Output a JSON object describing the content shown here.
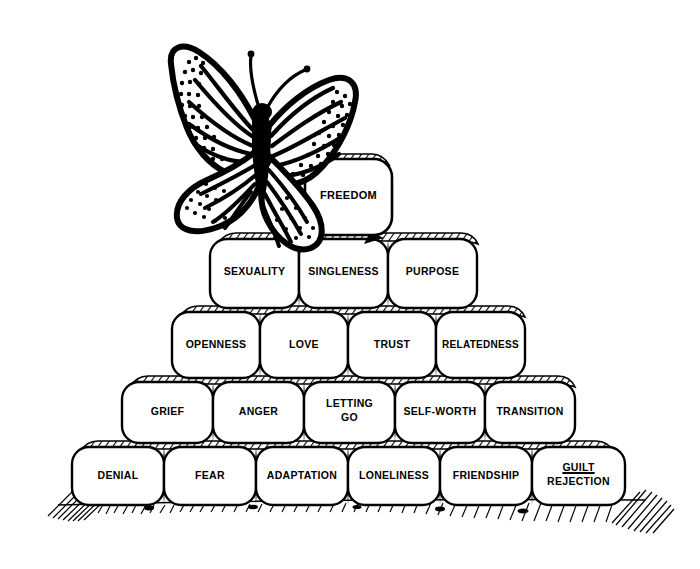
{
  "figure": {
    "title_text": "",
    "style": "black-and-white line drawing",
    "ink_color": "#000000",
    "background_color": "#ffffff"
  },
  "butterfly": {
    "name": "butterfly-illustration",
    "description": "monarch butterfly",
    "label": ""
  },
  "ground": {
    "name": "ground-hatching",
    "label": ""
  },
  "pyramid": {
    "rows": [
      {
        "row_index": 1,
        "name": "pyramid-row-top",
        "blocks": [
          {
            "label": "FREEDOM",
            "lines": [
              "FREEDOM"
            ],
            "underline_first_line": false
          }
        ]
      },
      {
        "row_index": 2,
        "name": "pyramid-row-2",
        "blocks": [
          {
            "label": "SEXUALITY",
            "lines": [
              "SEXUALITY"
            ],
            "underline_first_line": false
          },
          {
            "label": "SINGLENESS",
            "lines": [
              "SINGLENESS"
            ],
            "underline_first_line": false
          },
          {
            "label": "PURPOSE",
            "lines": [
              "PURPOSE"
            ],
            "underline_first_line": false
          }
        ]
      },
      {
        "row_index": 3,
        "name": "pyramid-row-3",
        "blocks": [
          {
            "label": "OPENNESS",
            "lines": [
              "OPENNESS"
            ],
            "underline_first_line": false
          },
          {
            "label": "LOVE",
            "lines": [
              "LOVE"
            ],
            "underline_first_line": false
          },
          {
            "label": "TRUST",
            "lines": [
              "TRUST"
            ],
            "underline_first_line": false
          },
          {
            "label": "RELATEDNESS",
            "lines": [
              "RELATEDNESS"
            ],
            "underline_first_line": false
          }
        ]
      },
      {
        "row_index": 4,
        "name": "pyramid-row-4",
        "blocks": [
          {
            "label": "GRIEF",
            "lines": [
              "GRIEF"
            ],
            "underline_first_line": false
          },
          {
            "label": "ANGER",
            "lines": [
              "ANGER"
            ],
            "underline_first_line": false
          },
          {
            "label": "LETTING GO",
            "lines": [
              "LETTING",
              "GO"
            ],
            "underline_first_line": false
          },
          {
            "label": "SELF-WORTH",
            "lines": [
              "SELF-WORTH"
            ],
            "underline_first_line": false
          },
          {
            "label": "TRANSITION",
            "lines": [
              "TRANSITION"
            ],
            "underline_first_line": false
          }
        ]
      },
      {
        "row_index": 5,
        "name": "pyramid-row-base",
        "blocks": [
          {
            "label": "DENIAL",
            "lines": [
              "DENIAL"
            ],
            "underline_first_line": false
          },
          {
            "label": "FEAR",
            "lines": [
              "FEAR"
            ],
            "underline_first_line": false
          },
          {
            "label": "ADAPTATION",
            "lines": [
              "ADAPTATION"
            ],
            "underline_first_line": false
          },
          {
            "label": "LONELINESS",
            "lines": [
              "LONELINESS"
            ],
            "underline_first_line": false
          },
          {
            "label": "FRIENDSHIP",
            "lines": [
              "FRIENDSHIP"
            ],
            "underline_first_line": false
          },
          {
            "label": "GUILT REJECTION",
            "lines": [
              "GUILT",
              "REJECTION"
            ],
            "underline_first_line": true
          }
        ]
      }
    ]
  },
  "labels": {
    "r1b1": "FREEDOM",
    "r2b1": "SEXUALITY",
    "r2b2": "SINGLENESS",
    "r2b3": "PURPOSE",
    "r3b1": "OPENNESS",
    "r3b2": "LOVE",
    "r3b3": "TRUST",
    "r3b4": "RELATEDNESS",
    "r4b1": "GRIEF",
    "r4b2": "ANGER",
    "r4b3a": "LETTING",
    "r4b3b": "GO",
    "r4b4": "SELF-WORTH",
    "r4b5": "TRANSITION",
    "r5b1": "DENIAL",
    "r5b2": "FEAR",
    "r5b3": "ADAPTATION",
    "r5b4": "LONELINESS",
    "r5b5": "FRIENDSHIP",
    "r5b6a": "GUILT",
    "r5b6b": "REJECTION"
  }
}
